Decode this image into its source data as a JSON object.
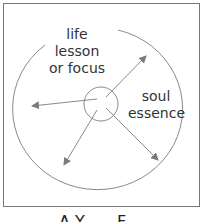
{
  "diagram": {
    "labels": {
      "outer": "life lesson\nor focus",
      "outer_line1": "life lesson",
      "outer_line2": "or focus",
      "inner_line1": "soul",
      "inner_line2": "essence"
    },
    "caption": "A  Y..  ...  F....",
    "colors": {
      "line": "#8a8a8a",
      "arrow": "#7a7a7a",
      "frame": "#777777",
      "text": "#333333"
    }
  }
}
